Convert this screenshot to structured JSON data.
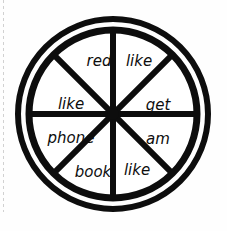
{
  "figure": {
    "shape": "circle-divided-into-eight-segments",
    "colors": {
      "ink": "#0d0d0d",
      "background": "#fefefe",
      "dashed_rule": "#c9c9c9"
    },
    "geometry": {
      "center_x": 113,
      "center_y": 114,
      "outer_radius": 98,
      "inner_radius": 85,
      "outer_stroke": 6,
      "inner_stroke": 7,
      "spoke_stroke": 6,
      "segment_count": 8
    }
  },
  "segments": [
    {
      "id": "segment-top-left",
      "label": "red",
      "angle_deg": 247.5,
      "x": 99,
      "y": 66,
      "font_size": 15,
      "rotation": 0
    },
    {
      "id": "segment-top-right",
      "label": "like",
      "angle_deg": 292.5,
      "x": 128,
      "y": 66,
      "font_size": 15,
      "rotation": 0
    },
    {
      "id": "segment-right-upper",
      "label": "get",
      "angle_deg": 337.5,
      "x": 157,
      "y": 105,
      "font_size": 15,
      "rotation": 0
    },
    {
      "id": "segment-right-lower",
      "label": "am",
      "angle_deg": 22.5,
      "x": 157,
      "y": 138,
      "font_size": 15,
      "rotation": 0
    },
    {
      "id": "segment-bottom-right",
      "label": "like",
      "angle_deg": 67.5,
      "x": 128,
      "y": 171,
      "font_size": 15,
      "rotation": 0
    },
    {
      "id": "segment-bottom-left",
      "label": "book",
      "angle_deg": 112.5,
      "x": 95,
      "y": 174,
      "font_size": 15,
      "rotation": 0
    },
    {
      "id": "segment-left-lower",
      "label": "phone",
      "angle_deg": 157.5,
      "x": 68,
      "y": 138,
      "font_size": 15,
      "rotation": 0
    },
    {
      "id": "segment-left-upper",
      "label": "like",
      "angle_deg": 202.5,
      "x": 70,
      "y": 105,
      "font_size": 15,
      "rotation": 0
    }
  ],
  "word_list": [
    "red",
    "like",
    "get",
    "am",
    "like",
    "book",
    "phone",
    "like"
  ]
}
